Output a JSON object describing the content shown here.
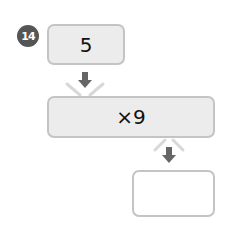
{
  "problem": {
    "number": "14",
    "start_value": "5",
    "operation": "×9",
    "answer_value": ""
  },
  "colors": {
    "badge": "#555555",
    "box_fill": "#ececec",
    "box_border": "#c4c4c4",
    "arrow": "#666666",
    "v_lines": "#d8d8d8"
  },
  "icons": {
    "arrow_1": "arrow-down-icon",
    "arrow_2": "arrow-down-icon"
  }
}
